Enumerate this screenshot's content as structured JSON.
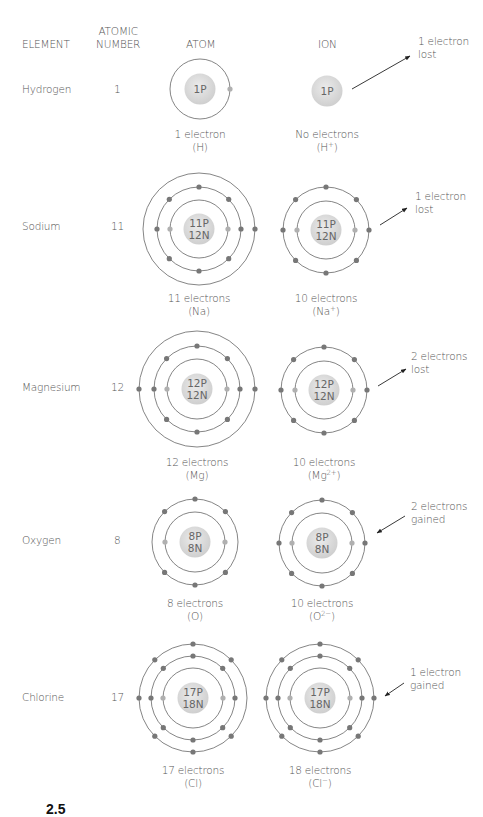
{
  "headers": {
    "element": "ELEMENT",
    "atomic_number_line1": "ATOMIC",
    "atomic_number_line2": "NUMBER",
    "atom": "ATOM",
    "ion": "ION"
  },
  "colors": {
    "text": "#555555",
    "ring": "#666666",
    "nucleus": "#d9d9d9",
    "nucleus_text": "#666666",
    "electron_outer": "#777777",
    "electron_inner": "#b0b0b0",
    "arrow": "#222222"
  },
  "figure_label": "2.5",
  "rows": [
    {
      "element": "Hydrogen",
      "atomic_number": "1",
      "y": 90,
      "atom": {
        "cx": 200,
        "cy": 89,
        "rings": [
          30
        ],
        "electrons": [
          [
            0,
            [
              "r"
            ]
          ]
        ],
        "nucleus": [
          "1P"
        ],
        "caption1": "1 electron",
        "caption2_base": "(H)",
        "caption2_sup": "",
        "caption2_end": "",
        "cap_y": 128
      },
      "ion": {
        "cx": 327,
        "cy": 91,
        "rings": [],
        "electrons": [],
        "nucleus": [
          "1P"
        ],
        "caption1": "No electrons",
        "caption2_base": "(H",
        "caption2_sup": "+",
        "caption2_end": ")",
        "cap_y": 128
      },
      "note": {
        "line1": "1 electron",
        "line2": "lost",
        "x": 418,
        "y": 35,
        "arrow": [
          352,
          89,
          410,
          56
        ]
      }
    },
    {
      "element": "Sodium",
      "atomic_number": "11",
      "y": 227,
      "atom": {
        "cx": 199,
        "cy": 229,
        "rings": [
          29,
          42,
          56
        ],
        "electrons": [
          [
            0,
            [
              "l",
              "r"
            ]
          ],
          [
            1,
            [
              "t",
              "tl",
              "tr",
              "l",
              "r",
              "bl",
              "br",
              "b"
            ]
          ],
          [
            2,
            [
              "r"
            ]
          ]
        ],
        "nucleus": [
          "11P",
          "12N"
        ],
        "caption1": "11 electrons",
        "caption2_base": "(Na)",
        "caption2_sup": "",
        "caption2_end": "",
        "cap_y": 292
      },
      "ion": {
        "cx": 326,
        "cy": 230,
        "rings": [
          29,
          43
        ],
        "electrons": [
          [
            0,
            [
              "l",
              "r"
            ]
          ],
          [
            1,
            [
              "t",
              "tl",
              "tr",
              "l",
              "r",
              "bl",
              "br",
              "b"
            ]
          ]
        ],
        "nucleus": [
          "11P",
          "12N"
        ],
        "caption1": "10 electrons",
        "caption2_base": "(Na",
        "caption2_sup": "+",
        "caption2_end": ")",
        "cap_y": 292
      },
      "note": {
        "line1": "1 electron",
        "line2": "lost",
        "x": 415,
        "y": 190,
        "arrow": [
          380,
          225,
          407,
          208
        ]
      }
    },
    {
      "element": "Magnesium",
      "atomic_number": "12",
      "y": 388,
      "atom": {
        "cx": 197,
        "cy": 389,
        "rings": [
          30,
          43,
          58
        ],
        "electrons": [
          [
            0,
            [
              "l",
              "r"
            ]
          ],
          [
            1,
            [
              "t",
              "tl",
              "tr",
              "l",
              "r",
              "bl",
              "br",
              "b"
            ]
          ],
          [
            2,
            [
              "l",
              "r"
            ]
          ]
        ],
        "nucleus": [
          "12P",
          "12N"
        ],
        "caption1": "12 electrons",
        "caption2_base": "(Mg)",
        "caption2_sup": "",
        "caption2_end": "",
        "cap_y": 456
      },
      "ion": {
        "cx": 324,
        "cy": 390,
        "rings": [
          29,
          43
        ],
        "electrons": [
          [
            0,
            [
              "l",
              "r"
            ]
          ],
          [
            1,
            [
              "t",
              "tl",
              "tr",
              "l",
              "r",
              "bl",
              "br",
              "b"
            ]
          ]
        ],
        "nucleus": [
          "12P",
          "12N"
        ],
        "caption1": "10 electrons",
        "caption2_base": "(Mg",
        "caption2_sup": "2+",
        "caption2_end": ")",
        "cap_y": 456
      },
      "note": {
        "line1": "2 electrons",
        "line2": "lost",
        "x": 411,
        "y": 350,
        "arrow": [
          378,
          386,
          406,
          369
        ]
      }
    },
    {
      "element": "Oxygen",
      "atomic_number": "8",
      "y": 541,
      "atom": {
        "cx": 195,
        "cy": 542,
        "rings": [
          30,
          43
        ],
        "electrons": [
          [
            0,
            [
              "l",
              "r"
            ]
          ],
          [
            1,
            [
              "t",
              "tl",
              "tr",
              "bl",
              "br",
              "b"
            ]
          ]
        ],
        "nucleus": [
          "8P",
          "8N"
        ],
        "caption1": "8 electrons",
        "caption2_base": "(O)",
        "caption2_sup": "",
        "caption2_end": "",
        "cap_y": 597
      },
      "ion": {
        "cx": 322,
        "cy": 543,
        "rings": [
          30,
          43
        ],
        "electrons": [
          [
            0,
            [
              "l",
              "r"
            ]
          ],
          [
            1,
            [
              "t",
              "tl",
              "tr",
              "l",
              "r",
              "bl",
              "br",
              "b"
            ]
          ]
        ],
        "nucleus": [
          "8P",
          "8N"
        ],
        "caption1": "10 electrons",
        "caption2_base": "(O",
        "caption2_sup": "2−",
        "caption2_end": ")",
        "cap_y": 597
      },
      "note": {
        "line1": "2 electrons",
        "line2": "gained",
        "x": 411,
        "y": 500,
        "arrow": [
          405,
          516,
          377,
          533
        ]
      }
    },
    {
      "element": "Chlorine",
      "atomic_number": "17",
      "y": 698,
      "atom": {
        "cx": 193,
        "cy": 698,
        "rings": [
          30,
          42,
          54
        ],
        "electrons": [
          [
            0,
            [
              "l",
              "r"
            ]
          ],
          [
            1,
            [
              "t",
              "tl",
              "tr",
              "l",
              "r",
              "bl",
              "br",
              "b"
            ]
          ],
          [
            2,
            [
              "t",
              "tl",
              "tr",
              "l",
              "bl",
              "br",
              "b"
            ]
          ]
        ],
        "nucleus": [
          "17P",
          "18N"
        ],
        "caption1": "17 electrons",
        "caption2_base": "(Cl)",
        "caption2_sup": "",
        "caption2_end": "",
        "cap_y": 764
      },
      "ion": {
        "cx": 320,
        "cy": 698,
        "rings": [
          30,
          42,
          54
        ],
        "electrons": [
          [
            0,
            [
              "l",
              "r"
            ]
          ],
          [
            1,
            [
              "t",
              "tl",
              "tr",
              "l",
              "r",
              "bl",
              "br",
              "b"
            ]
          ],
          [
            2,
            [
              "t",
              "tl",
              "tr",
              "l",
              "r",
              "bl",
              "br",
              "b"
            ]
          ]
        ],
        "nucleus": [
          "17P",
          "18N"
        ],
        "caption1": "18 electrons",
        "caption2_base": "(Cl",
        "caption2_sup": "−",
        "caption2_end": ")",
        "cap_y": 764
      },
      "note": {
        "line1": "1 electron",
        "line2": "gained",
        "x": 410,
        "y": 666,
        "arrow": [
          404,
          683,
          385,
          696
        ]
      }
    }
  ]
}
